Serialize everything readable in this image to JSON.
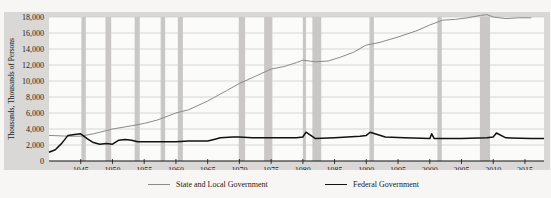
{
  "chart_data": {
    "type": "line",
    "title": "",
    "xlabel": "",
    "ylabel": "Thousands, Thousands of Persons",
    "ylim": [
      0,
      18000
    ],
    "xlim": [
      1940,
      2018
    ],
    "grid": true,
    "legend_position": "bottom",
    "y_ticks": [
      "0",
      "2,000",
      "4,000",
      "6,000",
      "8,000",
      "10,000",
      "12,000",
      "14,000",
      "16,000",
      "18,000"
    ],
    "y_tick_values": [
      0,
      2000,
      4000,
      6000,
      8000,
      10000,
      12000,
      14000,
      16000,
      18000
    ],
    "x_ticks": [
      "1945",
      "1950",
      "1955",
      "1960",
      "1965",
      "1970",
      "1975",
      "1980",
      "1985",
      "1990",
      "1995",
      "2000",
      "2005",
      "2010",
      "2015"
    ],
    "x_tick_values": [
      1945,
      1950,
      1955,
      1960,
      1965,
      1970,
      1975,
      1980,
      1985,
      1990,
      1995,
      2000,
      2005,
      2010,
      2015
    ],
    "recessions": [
      [
        1945.1,
        1945.8
      ],
      [
        1948.9,
        1949.8
      ],
      [
        1953.5,
        1954.3
      ],
      [
        1957.6,
        1958.3
      ],
      [
        1960.3,
        1961.1
      ],
      [
        1969.9,
        1970.9
      ],
      [
        1973.9,
        1975.2
      ],
      [
        1980.0,
        1980.5
      ],
      [
        1981.5,
        1982.9
      ],
      [
        1990.5,
        1991.2
      ],
      [
        2001.2,
        2001.9
      ],
      [
        2007.9,
        2009.5
      ]
    ],
    "series": [
      {
        "name": "State and Local Government",
        "color": "#8a8a8a",
        "x": [
          1940,
          1943,
          1945,
          1947,
          1950,
          1953,
          1955,
          1957,
          1960,
          1962,
          1965,
          1968,
          1970,
          1972,
          1975,
          1977,
          1979,
          1980,
          1982,
          1984,
          1986,
          1988,
          1990,
          1992,
          1995,
          1998,
          2000,
          2002,
          2004,
          2006,
          2008,
          2009,
          2010,
          2012,
          2014,
          2016
        ],
        "values": [
          3200,
          3100,
          3100,
          3400,
          4000,
          4400,
          4700,
          5100,
          6000,
          6400,
          7500,
          8800,
          9700,
          10400,
          11500,
          11800,
          12300,
          12600,
          12400,
          12500,
          13000,
          13600,
          14500,
          14800,
          15500,
          16300,
          17000,
          17600,
          17700,
          17900,
          18200,
          18300,
          18000,
          17800,
          17900,
          17900
        ]
      },
      {
        "name": "Federal Government",
        "color": "#111111",
        "x": [
          1940,
          1941,
          1942,
          1943,
          1944,
          1945,
          1946,
          1947,
          1948,
          1949,
          1950,
          1951,
          1952,
          1953,
          1954,
          1955,
          1957,
          1960,
          1962,
          1965,
          1966,
          1967,
          1969,
          1970,
          1972,
          1975,
          1979,
          1980,
          1980.5,
          1982,
          1985,
          1989,
          1990,
          1990.6,
          1993,
          1996,
          2000,
          2000.3,
          2000.7,
          2005,
          2009,
          2010,
          2010.5,
          2012,
          2016,
          2018
        ],
        "values": [
          1100,
          1400,
          2200,
          3200,
          3300,
          3400,
          2800,
          2300,
          2100,
          2200,
          2100,
          2600,
          2700,
          2600,
          2400,
          2400,
          2400,
          2400,
          2500,
          2500,
          2700,
          2900,
          3000,
          3000,
          2900,
          2900,
          2900,
          3000,
          3600,
          2800,
          2900,
          3100,
          3200,
          3600,
          3000,
          2900,
          2800,
          3400,
          2800,
          2800,
          2900,
          3000,
          3500,
          2900,
          2800,
          2800
        ]
      }
    ]
  },
  "legend": {
    "items": [
      {
        "label": "State and Local Government",
        "color": "#8a8a8a"
      },
      {
        "label": "Federal Government",
        "color": "#111111"
      }
    ]
  }
}
